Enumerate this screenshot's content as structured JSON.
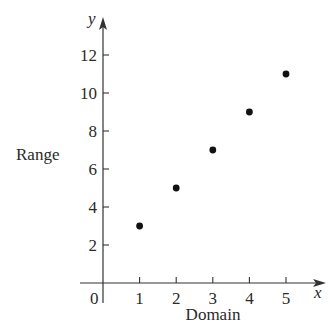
{
  "chart_data": {
    "type": "scatter",
    "title": "",
    "xlabel": "Domain",
    "ylabel": "Range",
    "x_axis_symbol": "x",
    "y_axis_symbol": "y",
    "origin_label": "0",
    "x_ticks": [
      "1",
      "2",
      "3",
      "4",
      "5"
    ],
    "y_ticks": [
      "2",
      "4",
      "6",
      "8",
      "10",
      "12"
    ],
    "xlim": [
      0,
      5.9
    ],
    "ylim": [
      0,
      13.8
    ],
    "grid": false,
    "legend": null,
    "points": [
      {
        "x": 1,
        "y": 3
      },
      {
        "x": 2,
        "y": 5
      },
      {
        "x": 3,
        "y": 7
      },
      {
        "x": 4,
        "y": 9
      },
      {
        "x": 5,
        "y": 11
      }
    ],
    "colors": {
      "axis": "#333333",
      "point": "#111111",
      "text": "#2a2a2a"
    }
  }
}
